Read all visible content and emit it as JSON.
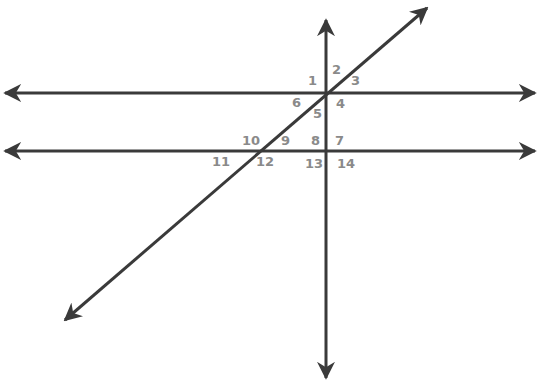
{
  "diagram": {
    "type": "geometry-angles",
    "colors": {
      "line": "#3a3a3a",
      "label": "#8a8a8a",
      "background": "#ffffff"
    },
    "lines": [
      {
        "id": "horizontal-top",
        "x1": 5,
        "y1": 93,
        "x2": 535,
        "y2": 93,
        "arrows": "both"
      },
      {
        "id": "horizontal-bottom",
        "x1": 5,
        "y1": 151,
        "x2": 535,
        "y2": 151,
        "arrows": "both"
      },
      {
        "id": "vertical",
        "x1": 326,
        "y1": 20,
        "x2": 326,
        "y2": 378,
        "arrows": "both"
      },
      {
        "id": "diagonal",
        "x1": 65,
        "y1": 320,
        "x2": 427,
        "y2": 8,
        "arrows": "both"
      }
    ],
    "angles": [
      {
        "label": "1",
        "x": 308,
        "y": 85
      },
      {
        "label": "2",
        "x": 332,
        "y": 74
      },
      {
        "label": "3",
        "x": 351,
        "y": 85
      },
      {
        "label": "4",
        "x": 336,
        "y": 108
      },
      {
        "label": "5",
        "x": 313,
        "y": 118
      },
      {
        "label": "6",
        "x": 292,
        "y": 107
      },
      {
        "label": "7",
        "x": 335,
        "y": 145
      },
      {
        "label": "8",
        "x": 311,
        "y": 145
      },
      {
        "label": "9",
        "x": 281,
        "y": 145
      },
      {
        "label": "10",
        "x": 242,
        "y": 145
      },
      {
        "label": "11",
        "x": 212,
        "y": 166
      },
      {
        "label": "12",
        "x": 256,
        "y": 166
      },
      {
        "label": "13",
        "x": 305,
        "y": 168
      },
      {
        "label": "14",
        "x": 337,
        "y": 168
      }
    ]
  }
}
